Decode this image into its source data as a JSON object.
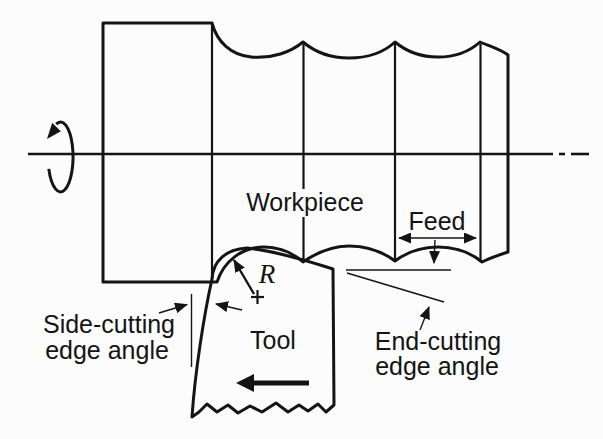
{
  "figure": {
    "type": "turning-operation-diagram",
    "labels": {
      "workpiece": "Workpiece",
      "feed": "Feed",
      "nose_radius": "R",
      "tool": "Tool",
      "side_cutting_line1": "Side-cutting",
      "side_cutting_line2": "edge angle",
      "end_cutting_line1": "End-cutting",
      "end_cutting_line2": "edge angle"
    },
    "colors": {
      "background": "#fcfcfc",
      "workpiece_fill": "#e7e7e7",
      "tool_fill": "#a7a7a7",
      "tool_stipple_dark": "#9a9a9a",
      "tool_stipple_light": "#b4b4b4",
      "line": "#141414"
    }
  }
}
